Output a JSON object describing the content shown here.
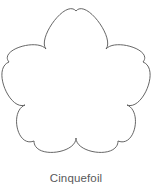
{
  "figure": {
    "caption": "Cinquefoil",
    "caption_color": "#58595b",
    "background_color": "#ffffff",
    "shape": {
      "name": "cinquefoil-outline",
      "lobe_count": 5,
      "fill_color": "#ffffff",
      "stroke_color": "#555555",
      "stroke_width": 0.9,
      "bounding_box": {
        "x": 9,
        "y": 11,
        "width": 134,
        "height": 142
      },
      "center": {
        "x": 76,
        "y": 85
      },
      "lobe_apexes": [
        {
          "label": "top",
          "x": 76,
          "y": 11
        },
        {
          "label": "upper-right",
          "x": 143,
          "y": 62
        },
        {
          "label": "lower-right",
          "x": 118,
          "y": 141
        },
        {
          "label": "lower-left",
          "x": 34,
          "y": 141
        },
        {
          "label": "upper-left",
          "x": 9,
          "y": 62
        }
      ],
      "cusps": [
        {
          "label": "upper-right-cusp",
          "x": 106,
          "y": 49
        },
        {
          "label": "right-cusp",
          "x": 127,
          "y": 105
        },
        {
          "label": "bottom-center-cusp",
          "x": 76,
          "y": 138
        },
        {
          "label": "left-cusp",
          "x": 25,
          "y": 105
        },
        {
          "label": "upper-left-cusp",
          "x": 46,
          "y": 49
        }
      ]
    }
  }
}
